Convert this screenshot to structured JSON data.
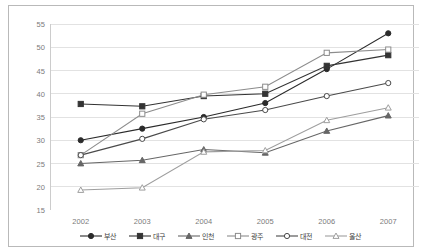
{
  "chart_data": {
    "type": "line",
    "title": "",
    "xlabel": "",
    "ylabel": "",
    "x": [
      "2002",
      "2003",
      "2004",
      "2005",
      "2006",
      "2007"
    ],
    "categories": [
      "2002",
      "2003",
      "2004",
      "2005",
      "2006",
      "2007"
    ],
    "ylim": [
      15,
      55
    ],
    "yticks": [
      15,
      20,
      25,
      30,
      35,
      40,
      45,
      50,
      55
    ],
    "grid": "horizontal",
    "legend_position": "bottom",
    "series": [
      {
        "name": "부산",
        "marker": "filled-circle",
        "color": "#2b2b2b",
        "values": [
          30.0,
          32.5,
          35.0,
          38.0,
          45.3,
          53.0
        ]
      },
      {
        "name": "대구",
        "marker": "filled-square",
        "color": "#333333",
        "values": [
          37.8,
          37.3,
          39.5,
          40.0,
          46.0,
          48.3
        ]
      },
      {
        "name": "인천",
        "marker": "filled-triangle",
        "color": "#666666",
        "values": [
          25.0,
          25.7,
          28.0,
          27.3,
          32.0,
          35.3
        ]
      },
      {
        "name": "광주",
        "marker": "open-square",
        "color": "#8c8c8c",
        "values": [
          26.8,
          35.7,
          39.8,
          41.5,
          48.8,
          49.5
        ]
      },
      {
        "name": "대전",
        "marker": "open-circle",
        "color": "#4a4a4a",
        "values": [
          26.8,
          30.3,
          34.5,
          36.5,
          39.5,
          42.3
        ]
      },
      {
        "name": "울산",
        "marker": "open-triangle",
        "color": "#9e9e9e",
        "values": [
          19.3,
          19.8,
          27.5,
          27.8,
          34.3,
          37.0
        ]
      }
    ]
  }
}
